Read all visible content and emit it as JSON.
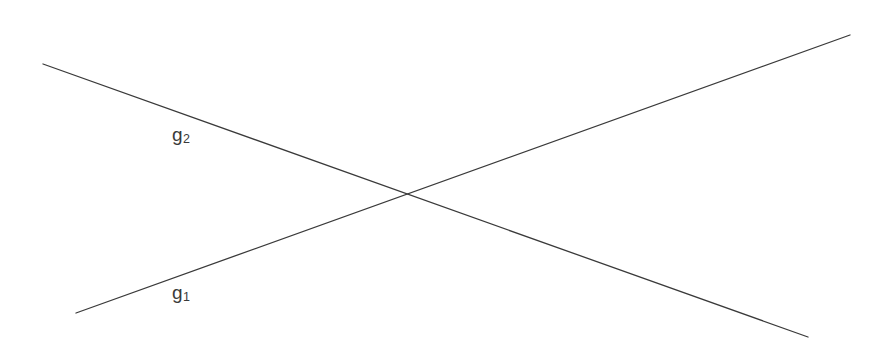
{
  "figure": {
    "width": 885,
    "height": 353,
    "background_color": "#ffffff",
    "line_color": "#3a3a3a",
    "label_color": "#3a3a3a",
    "stroke_width": 1.3
  },
  "chart_data": {
    "type": "line",
    "title": "",
    "subtitle": "",
    "xlabel": "",
    "ylabel": "",
    "grid": false,
    "legend_position": "inline-labels",
    "axes_visible": false,
    "tick_labels": [],
    "annotations": [],
    "coordinate_note": "Pixel coordinates in image space; y increases downward.",
    "xlim": [
      0,
      885
    ],
    "ylim": [
      0,
      353
    ],
    "intersection": {
      "label": "",
      "x": 402,
      "y": 195
    },
    "series": [
      {
        "name": "g₁",
        "label_text": "g",
        "label_sub": "1",
        "direction": "ascending",
        "x": [
          76,
          850
        ],
        "y": [
          313,
          35
        ],
        "label_x": 172,
        "label_y": 283
      },
      {
        "name": "g₂",
        "label_text": "g",
        "label_sub": "2",
        "direction": "descending",
        "x": [
          43,
          808
        ],
        "y": [
          64,
          337
        ],
        "label_x": 172,
        "label_y": 125
      }
    ]
  }
}
